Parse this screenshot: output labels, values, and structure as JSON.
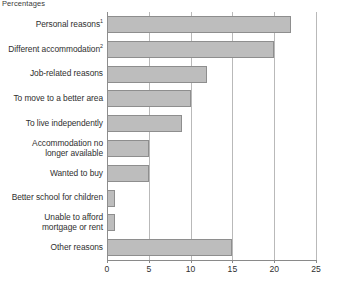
{
  "chart": {
    "title": "Percentages"
  },
  "chart_data": {
    "type": "bar",
    "orientation": "horizontal",
    "title": "Percentages",
    "xlabel": "",
    "ylabel": "",
    "xlim": [
      0,
      25
    ],
    "xticks": [
      0,
      5,
      10,
      15,
      20,
      25
    ],
    "grid": true,
    "legend": "none",
    "bar_color": "#bdbdbd",
    "bar_border_color": "#8e8e8e",
    "categories": [
      "Personal reasons",
      "Different accommodation",
      "Job-related reasons",
      "To move to a better area",
      "To live independently",
      "Accommodation no longer available",
      "Wanted to buy",
      "Better school for children",
      "Unable to afford mortgage or rent",
      "Other reasons"
    ],
    "category_labels": [
      {
        "text": "Personal reasons",
        "superscript": "1",
        "lines": [
          "Personal reasons"
        ]
      },
      {
        "text": "Different accommodation",
        "superscript": "2",
        "lines": [
          "Different accommodation"
        ]
      },
      {
        "text": "Job-related reasons",
        "superscript": "",
        "lines": [
          "Job-related reasons"
        ]
      },
      {
        "text": "To move to a better area",
        "superscript": "",
        "lines": [
          "To move to a better area"
        ]
      },
      {
        "text": "To live independently",
        "superscript": "",
        "lines": [
          "To live independently"
        ]
      },
      {
        "text": "Accommodation no longer available",
        "superscript": "",
        "lines": [
          "Accommodation no",
          "longer available"
        ]
      },
      {
        "text": "Wanted to buy",
        "superscript": "",
        "lines": [
          "Wanted to buy"
        ]
      },
      {
        "text": "Better school for children",
        "superscript": "",
        "lines": [
          "Better school for children"
        ]
      },
      {
        "text": "Unable to afford mortgage or rent",
        "superscript": "",
        "lines": [
          "Unable to afford",
          "mortgage or rent"
        ]
      },
      {
        "text": "Other reasons",
        "superscript": "",
        "lines": [
          "Other reasons"
        ]
      }
    ],
    "values": [
      22,
      20,
      12,
      10,
      9,
      5,
      5,
      1,
      1,
      15
    ]
  }
}
